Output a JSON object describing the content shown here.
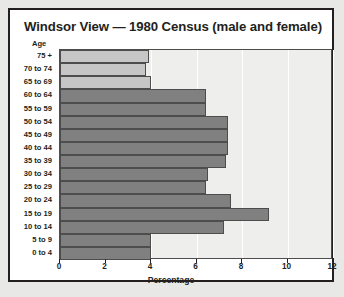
{
  "figure": {
    "title": "Windsor View — 1980 Census (male and female)",
    "age_axis_label": "Age",
    "x_axis_title": "Percentage"
  },
  "colors": {
    "bar_dark": "#808080",
    "bar_light": "#c6c6c6",
    "bar_border": "#4d4d4d",
    "plot_background": "#eeeeec",
    "panel_background": "#ffffff",
    "page_background": "#e8e8e6",
    "text": "#231f20"
  },
  "chart_data": {
    "type": "bar",
    "orientation": "horizontal",
    "title": "Windsor View — 1980 Census (male and female)",
    "xlabel": "Percentage",
    "ylabel": "Age",
    "xlim": [
      0,
      12
    ],
    "xticks": [
      0,
      2,
      4,
      6,
      8,
      10,
      12
    ],
    "xtick_labels": [
      "0",
      "2",
      "4",
      "6",
      "8",
      "10",
      "12"
    ],
    "grid": true,
    "legend": false,
    "categories": [
      "75 +",
      "70 to 74",
      "65 to 69",
      "60 to 64",
      "55 to 59",
      "50 to 54",
      "45 to 49",
      "40 to 44",
      "35 to 39",
      "30 to 34",
      "25 to 29",
      "20 to 24",
      "15 to 19",
      "10 to 14",
      "5 to 9",
      "0 to 4"
    ],
    "values": [
      3.9,
      3.8,
      4.0,
      6.4,
      6.4,
      7.4,
      7.4,
      7.4,
      7.3,
      6.5,
      6.4,
      7.5,
      9.2,
      7.2,
      4.0,
      4.0
    ],
    "bar_styles": [
      "light",
      "light",
      "light",
      "dark",
      "dark",
      "dark",
      "dark",
      "dark",
      "dark",
      "dark",
      "dark",
      "dark",
      "dark",
      "dark",
      "dark",
      "dark"
    ]
  }
}
